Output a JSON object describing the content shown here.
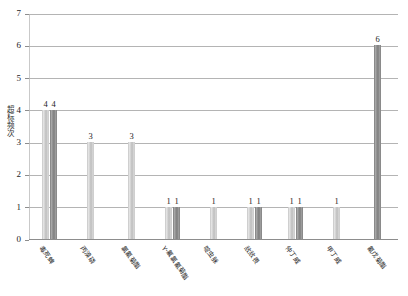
{
  "chart_data": {
    "type": "bar",
    "title": "",
    "xlabel": "",
    "ylabel": "超标频次",
    "ylim": [
      0,
      7
    ],
    "yticks": [
      0,
      1,
      2,
      3,
      4,
      5,
      6,
      7
    ],
    "grid": true,
    "legend": "none",
    "categories": [
      "毒死蜱",
      "丙溴磷",
      "氯氰菊酯",
      "γ-氟氯氰菊酯",
      "啶虫脒",
      "敌敌畏",
      "仲丁威",
      "甲丁威",
      "氰戊菊酯"
    ],
    "groups": [
      {
        "category": "毒死蜱",
        "bars": [
          {
            "value": 4,
            "shade": "light"
          },
          {
            "value": 4,
            "shade": "dark"
          }
        ]
      },
      {
        "category": "丙溴磷",
        "bars": [
          {
            "value": 3,
            "shade": "light"
          }
        ]
      },
      {
        "category": "氯氰菊酯",
        "bars": [
          {
            "value": 3,
            "shade": "light"
          }
        ]
      },
      {
        "category": "γ-氟氯氰菊酯",
        "bars": [
          {
            "value": 1,
            "shade": "light"
          },
          {
            "value": 1,
            "shade": "dark"
          }
        ]
      },
      {
        "category": "啶虫脒",
        "bars": [
          {
            "value": 1,
            "shade": "light"
          }
        ]
      },
      {
        "category": "敌敌畏",
        "bars": [
          {
            "value": 1,
            "shade": "light"
          },
          {
            "value": 1,
            "shade": "dark"
          }
        ]
      },
      {
        "category": "仲丁威",
        "bars": [
          {
            "value": 1,
            "shade": "light"
          },
          {
            "value": 1,
            "shade": "dark"
          }
        ]
      },
      {
        "category": "甲丁威",
        "bars": [
          {
            "value": 1,
            "shade": "light"
          }
        ]
      },
      {
        "category": "氰戊菊酯",
        "bars": [
          {
            "value": 6,
            "shade": "dark"
          }
        ]
      }
    ],
    "colors": {
      "bar_light": "#d2d2d2",
      "bar_dark": "#8f8f8f",
      "gridline": "#b4b4b4",
      "axis": "#8d8d8d",
      "text": "#1d1d1d"
    }
  }
}
